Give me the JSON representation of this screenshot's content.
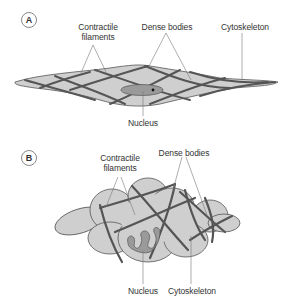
{
  "panels": [
    {
      "id": "A",
      "badge": "A",
      "labels": {
        "contractile_line1": "Contractile",
        "contractile_line2": "filaments",
        "dense_bodies": "Dense bodies",
        "cytoskeleton": "Cytoskeleton",
        "nucleus": "Nucleus"
      }
    },
    {
      "id": "B",
      "badge": "B",
      "labels": {
        "contractile_line1": "Contractile",
        "contractile_line2": "filaments",
        "dense_bodies": "Dense bodies",
        "cytoskeleton": "Cytoskeleton",
        "nucleus": "Nucleus"
      }
    }
  ],
  "colors": {
    "cell_fill": "#cfcfcf",
    "cell_outline": "#555555",
    "filament": "#555555",
    "nucleus_fill": "#9a9a9a",
    "leader_line": "#777777",
    "text": "#333333"
  }
}
